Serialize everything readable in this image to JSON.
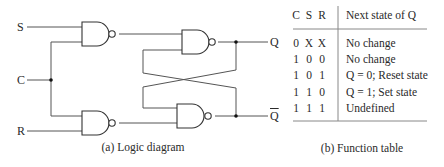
{
  "diagram": {
    "inputs": {
      "s": "S",
      "c": "C",
      "r": "R"
    },
    "outputs": {
      "q": "Q",
      "q_bar": "Q"
    },
    "gates": [
      "NAND",
      "NAND",
      "NAND",
      "NAND"
    ],
    "caption": "(a) Logic diagram"
  },
  "function_table": {
    "headers": {
      "c": "C",
      "s": "S",
      "r": "R",
      "next": "Next state of Q"
    },
    "rows": [
      {
        "c": "0",
        "s": "X",
        "r": "X",
        "next": "No change"
      },
      {
        "c": "1",
        "s": "0",
        "r": "0",
        "next": "No change"
      },
      {
        "c": "1",
        "s": "0",
        "r": "1",
        "next": "Q = 0; Reset state"
      },
      {
        "c": "1",
        "s": "1",
        "r": "0",
        "next": "Q = 1; Set state"
      },
      {
        "c": "1",
        "s": "1",
        "r": "1",
        "next": "Undefined"
      }
    ],
    "caption": "(b) Function table"
  },
  "colors": {
    "line": "#555555",
    "gate": "#333333",
    "rule": "#888888"
  }
}
